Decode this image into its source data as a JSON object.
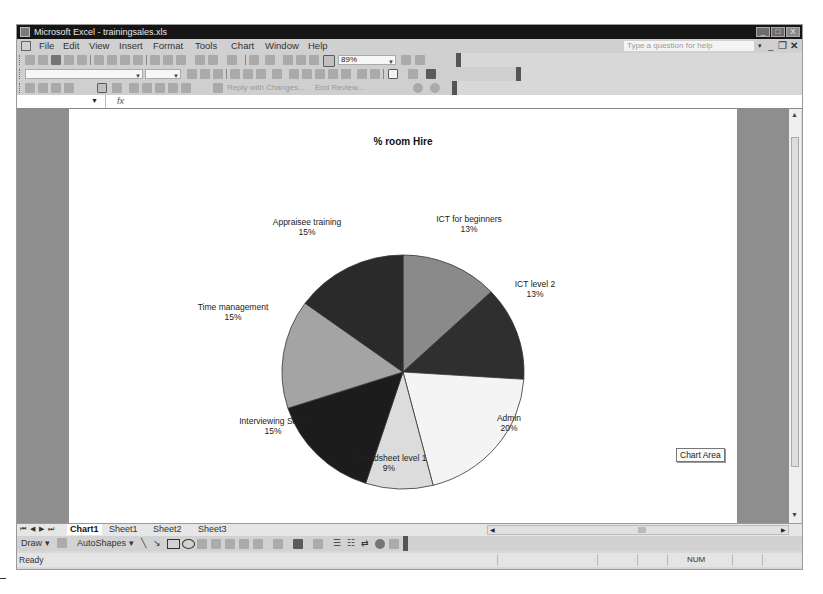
{
  "window": {
    "title": "Microsoft Excel - trainingsales.xls",
    "controls": {
      "minimize": "_",
      "maximize": "□",
      "close": "X"
    }
  },
  "menu": {
    "items": [
      "File",
      "Edit",
      "View",
      "Insert",
      "Format",
      "Tools",
      "Chart",
      "Window",
      "Help"
    ],
    "help_placeholder": "Type a question for help",
    "doc_controls": {
      "minimize": "_",
      "restore": "❐",
      "close": "✕"
    }
  },
  "standard_toolbar": {
    "zoom_value": "89%"
  },
  "reviewing_toolbar": {
    "reply_label": "Reply with Changes...",
    "end_review_label": "End Review..."
  },
  "formula_bar": {
    "name_box": "",
    "fx_label": "fx",
    "value": ""
  },
  "chart": {
    "title": "% room Hire",
    "tooltip": "Chart Area"
  },
  "chart_data": {
    "type": "pie",
    "title": "% room Hire",
    "categories": [
      "ICT for beginners",
      "ICT level 2",
      "Admin",
      "Spreadsheet level 1",
      "Interviewing Skills",
      "Time management",
      "Appraisee training"
    ],
    "values": [
      13,
      13,
      20,
      9,
      15,
      15,
      15
    ],
    "labels": [
      "13%",
      "13%",
      "20%",
      "9%",
      "15%",
      "15%",
      "15%"
    ],
    "colors": [
      "#8a8a8a",
      "#2f2f2f",
      "#f4f4f4",
      "#dcdcdc",
      "#1c1c1c",
      "#a4a4a4",
      "#2a2a2a"
    ],
    "legend": "none",
    "data_labels": "category name and percentage"
  },
  "sheet_tabs": {
    "tabs": [
      "Chart1",
      "Sheet1",
      "Sheet2",
      "Sheet3"
    ],
    "active": "Chart1",
    "nav": [
      "⏮",
      "◀",
      "▶",
      "⏭"
    ]
  },
  "drawing_toolbar": {
    "draw_label": "Draw ▾",
    "autoshapes_label": "AutoShapes ▾"
  },
  "status_bar": {
    "status": "Ready",
    "num_indicator": "NUM"
  }
}
